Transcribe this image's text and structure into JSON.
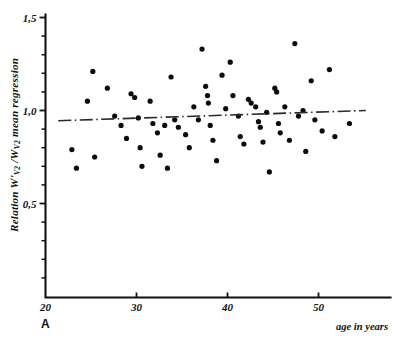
{
  "figure": {
    "panel_label": "A",
    "background_color": "#ffffff",
    "ink_color": "#111111"
  },
  "chart_data": {
    "type": "scatter",
    "title": "",
    "subtitle": "",
    "xlabel": "age in years",
    "ylabel": "Relation W'v2 /Wv2 mean regression",
    "ylabel_parts": {
      "lead": "Relation ",
      "num_symbol": "W'",
      "num_sub": "V2",
      "slash": " /",
      "den_symbol": "W",
      "den_sub": "V2",
      "tail": " mean regression"
    },
    "xlim": [
      20,
      56
    ],
    "ylim": [
      0,
      1.62
    ],
    "x_ticks_major": [
      20,
      30,
      40,
      50
    ],
    "x_tick_labels": [
      "20",
      "30",
      "40",
      "50"
    ],
    "y_ticks_major": [
      0.5,
      1.0,
      1.5
    ],
    "y_tick_labels": [
      "0,5",
      "1,0",
      "1,5"
    ],
    "y_ticks_minor": [
      0.1,
      0.2,
      0.3,
      0.4,
      0.6,
      0.7,
      0.8,
      0.9,
      1.1,
      1.2,
      1.3,
      1.4
    ],
    "grid": false,
    "legend": null,
    "marker": "filled-circle",
    "marker_color": "#0b0b0b",
    "marker_radius_px": 2.6,
    "points": [
      [
        22.9,
        0.79
      ],
      [
        23.4,
        0.69
      ],
      [
        24.6,
        1.05
      ],
      [
        25.2,
        1.21
      ],
      [
        25.4,
        0.75
      ],
      [
        26.8,
        1.12
      ],
      [
        27.6,
        0.97
      ],
      [
        28.3,
        0.92
      ],
      [
        28.9,
        0.85
      ],
      [
        29.4,
        1.09
      ],
      [
        29.8,
        1.07
      ],
      [
        30.2,
        0.96
      ],
      [
        30.4,
        0.8
      ],
      [
        30.6,
        0.7
      ],
      [
        31.5,
        1.05
      ],
      [
        31.8,
        0.93
      ],
      [
        32.3,
        0.88
      ],
      [
        32.6,
        0.76
      ],
      [
        33.1,
        0.92
      ],
      [
        33.4,
        0.69
      ],
      [
        33.8,
        1.18
      ],
      [
        34.2,
        0.95
      ],
      [
        34.6,
        0.91
      ],
      [
        35.4,
        0.87
      ],
      [
        35.8,
        0.8
      ],
      [
        36.3,
        1.02
      ],
      [
        36.8,
        0.95
      ],
      [
        37.2,
        1.33
      ],
      [
        37.6,
        1.13
      ],
      [
        37.8,
        1.08
      ],
      [
        37.9,
        1.04
      ],
      [
        38.1,
        0.92
      ],
      [
        38.4,
        0.84
      ],
      [
        38.8,
        0.73
      ],
      [
        39.4,
        1.19
      ],
      [
        39.8,
        1.01
      ],
      [
        40.3,
        1.26
      ],
      [
        40.6,
        1.08
      ],
      [
        41.2,
        0.97
      ],
      [
        41.4,
        0.86
      ],
      [
        41.8,
        0.82
      ],
      [
        42.3,
        1.06
      ],
      [
        42.6,
        1.04
      ],
      [
        43.1,
        1.02
      ],
      [
        43.4,
        0.94
      ],
      [
        43.6,
        0.91
      ],
      [
        43.9,
        0.83
      ],
      [
        44.3,
        0.99
      ],
      [
        44.6,
        0.67
      ],
      [
        45.2,
        1.12
      ],
      [
        45.4,
        1.1
      ],
      [
        45.6,
        0.93
      ],
      [
        45.8,
        0.88
      ],
      [
        46.3,
        1.02
      ],
      [
        46.8,
        0.84
      ],
      [
        47.4,
        1.36
      ],
      [
        47.8,
        0.97
      ],
      [
        48.3,
        1.0
      ],
      [
        48.6,
        0.78
      ],
      [
        49.2,
        1.16
      ],
      [
        49.6,
        0.95
      ],
      [
        50.4,
        0.89
      ],
      [
        51.2,
        1.22
      ],
      [
        51.8,
        0.86
      ],
      [
        53.4,
        0.93
      ]
    ],
    "regression_line": {
      "style": "dash-dot",
      "x_start": 21.4,
      "y_start": 0.945,
      "x_end": 55.2,
      "y_end": 1.0,
      "color": "#2a2a2a"
    }
  }
}
